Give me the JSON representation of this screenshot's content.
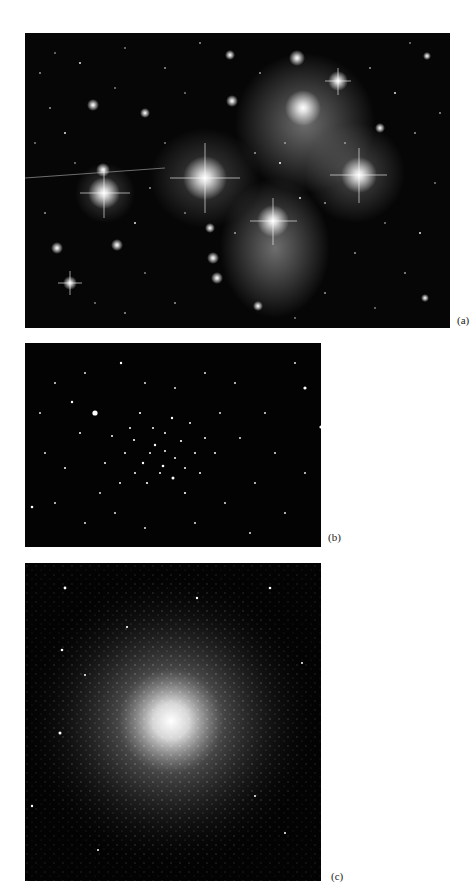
{
  "figure": {
    "panels": [
      {
        "id": "a",
        "label": "(a)",
        "subject": "open star cluster with reflection nebulosity (bright stars with diffraction spikes)"
      },
      {
        "id": "b",
        "label": "(b)",
        "subject": "open star cluster (sparse star field)"
      },
      {
        "id": "c",
        "label": "(c)",
        "subject": "globular star cluster (dense core)"
      }
    ],
    "colors": {
      "background": "#ffffff",
      "sky": "#050505",
      "star": "#ffffff"
    }
  }
}
